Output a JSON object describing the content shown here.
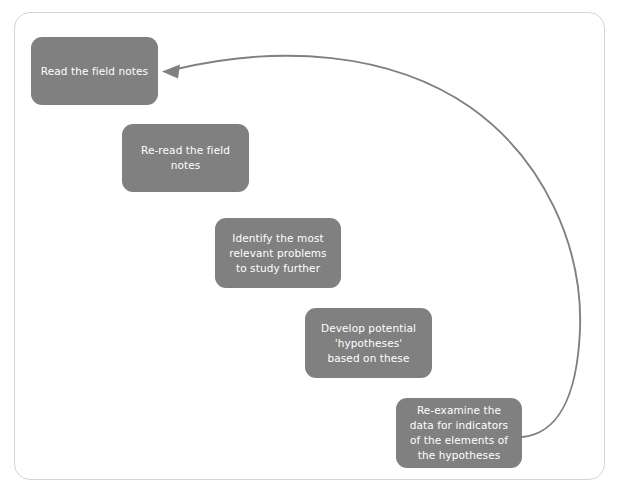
{
  "diagram": {
    "background_color": "#ffffff",
    "frame": {
      "border_color": "#d5d5d5",
      "corner_radius": "16px"
    },
    "node_fill_color": "#808080",
    "node_text_color": "#ffffff",
    "connector_color": "#808080",
    "nodes": [
      {
        "id": "read-the-field-notes",
        "step": 1,
        "label": "Read the field notes"
      },
      {
        "id": "re-read-the-field-notes",
        "step": 2,
        "label": "Re-read the field\nnotes"
      },
      {
        "id": "identify-the-most-relevant-problems",
        "step": 3,
        "label": "Identify the most\nrelevant problems\nto study further"
      },
      {
        "id": "develop-potential-hypotheses",
        "step": 4,
        "label": "Develop potential\n'hypotheses'\nbased on these"
      },
      {
        "id": "re-examine-the-data",
        "step": 5,
        "label": "Re-examine the\ndata for indicators\nof the elements of\nthe hypotheses"
      }
    ],
    "connectors": [
      {
        "id": "feedback-loop",
        "from": "re-examine-the-data",
        "to": "read-the-field-notes",
        "style": "curved",
        "arrowhead": "end"
      }
    ]
  }
}
